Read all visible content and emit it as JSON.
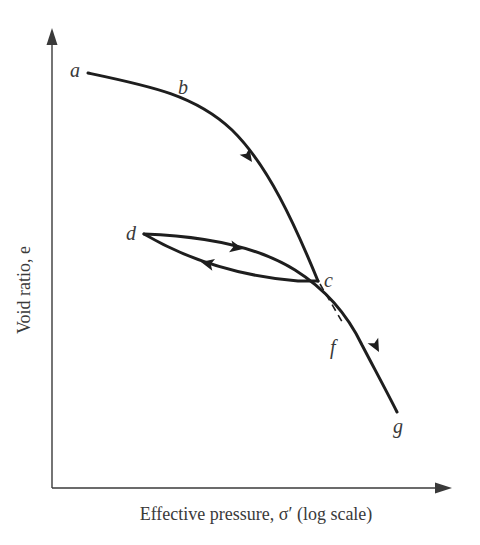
{
  "figure": {
    "x_axis_label": "Effective pressure, σ′ (log scale)",
    "y_axis_label": "Void ratio, e",
    "points": {
      "a": "a",
      "b": "b",
      "c": "c",
      "d": "d",
      "f": "f",
      "g": "g"
    },
    "segments": [
      {
        "from": "a",
        "to": "c",
        "via": "b",
        "style": "solid",
        "direction": "loading"
      },
      {
        "from": "c",
        "to": "d",
        "style": "solid",
        "direction": "unloading"
      },
      {
        "from": "d",
        "to": "g",
        "via": "f",
        "style": "solid",
        "direction": "reloading"
      },
      {
        "from": "c",
        "to": "f",
        "style": "dashed",
        "direction": "virgin-extension"
      }
    ],
    "colors": {
      "curve": "#1e1e1e",
      "axis": "#3a3a3a",
      "background": "#ffffff"
    }
  }
}
